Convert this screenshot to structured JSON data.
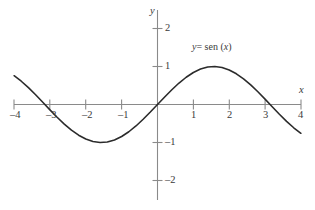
{
  "chart_data": {
    "type": "line",
    "title": "",
    "subtitle": "",
    "xlabel": "x",
    "ylabel": "y",
    "xlim": [
      -4,
      4
    ],
    "ylim": [
      -2.6,
      2.4
    ],
    "grid": false,
    "legend_position": "inside-upper-right",
    "series": [
      {
        "name": "y = sen (x)",
        "expression": "sin(x)",
        "color": "#2b2b2b",
        "x": [
          -4,
          -3.8,
          -3.6,
          -3.4,
          -3.2,
          -3,
          -2.8,
          -2.6,
          -2.4,
          -2.2,
          -2,
          -1.8,
          -1.6,
          -1.4,
          -1.2,
          -1,
          -0.8,
          -0.6,
          -0.4,
          -0.2,
          0,
          0.2,
          0.4,
          0.6,
          0.8,
          1,
          1.2,
          1.4,
          1.6,
          1.8,
          2,
          2.2,
          2.4,
          2.6,
          2.8,
          3,
          3.2,
          3.4,
          3.6,
          3.8,
          4
        ],
        "y": [
          0.757,
          0.612,
          0.443,
          0.256,
          0.058,
          -0.141,
          -0.335,
          -0.516,
          -0.675,
          -0.808,
          -0.909,
          -0.974,
          -1.0,
          -0.985,
          -0.932,
          -0.841,
          -0.717,
          -0.565,
          -0.389,
          -0.199,
          0,
          0.199,
          0.389,
          0.565,
          0.717,
          0.841,
          0.932,
          0.985,
          1.0,
          0.974,
          0.909,
          0.808,
          0.675,
          0.516,
          0.335,
          0.141,
          -0.058,
          -0.256,
          -0.443,
          -0.612,
          -0.757
        ]
      }
    ],
    "x_ticks": [
      {
        "value": -4,
        "label": "–4"
      },
      {
        "value": -3,
        "label": "–3"
      },
      {
        "value": -2,
        "label": "–2"
      },
      {
        "value": -1,
        "label": "–1"
      },
      {
        "value": 1,
        "label": "1"
      },
      {
        "value": 2,
        "label": "2"
      },
      {
        "value": 3,
        "label": "3"
      },
      {
        "value": 4,
        "label": "4"
      }
    ],
    "y_ticks": [
      {
        "value": 2,
        "label": "2"
      },
      {
        "value": 1,
        "label": "1"
      },
      {
        "value": -1,
        "label": "–1"
      },
      {
        "value": -2,
        "label": "–2"
      }
    ],
    "annotations": [
      {
        "name": "curve-equation",
        "text": "y = sen (x)",
        "x": 1.1,
        "y": 1.55
      }
    ],
    "colors": {
      "axis": "#8a8a8a",
      "curve": "#2b2b2b",
      "text": "#3a3a3a",
      "background": "#ffffff"
    }
  },
  "labels": {
    "x_axis_name": "x",
    "y_axis_name": "y",
    "equation_lhs": "y",
    "equation_eq": "= sen (",
    "equation_var": "x",
    "equation_close": ")",
    "equation_full": "y = sen (x)",
    "x_tick_m4": "–4",
    "x_tick_m3": "–3",
    "x_tick_m2": "–2",
    "x_tick_m1": "–1",
    "x_tick_1": "1",
    "x_tick_2": "2",
    "x_tick_3": "3",
    "x_tick_4": "4",
    "y_tick_2": "2",
    "y_tick_1": "1",
    "y_tick_m1": "–1",
    "y_tick_m2": "–2"
  }
}
